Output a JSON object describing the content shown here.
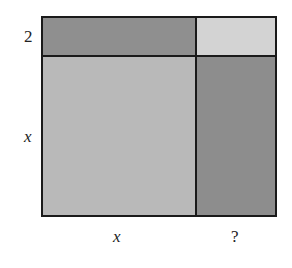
{
  "figure": {
    "labels": {
      "top_side_left": "2",
      "left_side_bottom": "x",
      "bottom_left": "x",
      "bottom_right": "?"
    },
    "regions": [
      {
        "name": "top-left",
        "color": "#8f8f8f"
      },
      {
        "name": "top-right",
        "color": "#d3d3d3"
      },
      {
        "name": "bottom-left",
        "color": "#b9b9b9"
      },
      {
        "name": "bottom-right",
        "color": "#8d8d8d"
      }
    ],
    "border_color": "#1a1a1a"
  }
}
